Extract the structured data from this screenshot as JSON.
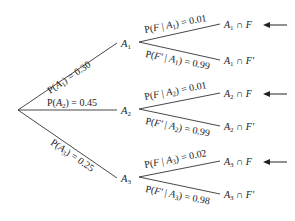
{
  "diagram": {
    "type": "probability-tree",
    "root": "",
    "level1": [
      {
        "node": "A1",
        "label": "P(A1) = 0.30"
      },
      {
        "node": "A2",
        "label": "P(A2) = 0.45"
      },
      {
        "node": "A3",
        "label": "P(A3) = 0.25"
      }
    ],
    "level2": [
      {
        "parent": "A1",
        "label": "P(F | A1) = 0.01",
        "outcome": "A1 ∩ F",
        "highlighted": true
      },
      {
        "parent": "A1",
        "label": "P(F′ | A1) = 0.99",
        "outcome": "A1 ∩ F′",
        "highlighted": false
      },
      {
        "parent": "A2",
        "label": "P(F | A2) = 0.01",
        "outcome": "A2 ∩ F",
        "highlighted": true
      },
      {
        "parent": "A2",
        "label": "P(F′ | A2) = 0.99",
        "outcome": "A2 ∩ F′",
        "highlighted": false
      },
      {
        "parent": "A3",
        "label": "P(F | A3) = 0.02",
        "outcome": "A3 ∩ F",
        "highlighted": true
      },
      {
        "parent": "A3",
        "label": "P(F′ | A3) = 0.98",
        "outcome": "A3 ∩ F′",
        "highlighted": false
      }
    ],
    "arrow_icon": "left-arrow"
  },
  "text": {
    "pA1_pre": "P(",
    "pA1_var": "A",
    "pA1_sub": "1",
    "pA1_post": ") = 0.30",
    "pA2_pre": "P(",
    "pA2_var": "A",
    "pA2_sub": "2",
    "pA2_post": ") = 0.45",
    "pA3_pre": "P(",
    "pA3_var": "A",
    "pA3_sub": "3",
    "pA3_post": ") = 0.25",
    "n1_var": "A",
    "n1_sub": "1",
    "n2_var": "A",
    "n2_sub": "2",
    "n3_var": "A",
    "n3_sub": "3",
    "b1_pre": "P(",
    "b1_var": "F",
    "b1_mid": " | ",
    "b1_A": "A",
    "b1_sub": "1",
    "b1_post": ") = 0.01",
    "b2_pre": "P(",
    "b2_var": "F′",
    "b2_mid": " | ",
    "b2_A": "A",
    "b2_sub": "1",
    "b2_post": ") = 0.99",
    "b3_pre": "P(",
    "b3_var": "F",
    "b3_mid": " | ",
    "b3_A": "A",
    "b3_sub": "2",
    "b3_post": ") = 0.01",
    "b4_pre": "P(",
    "b4_var": "F′",
    "b4_mid": " | ",
    "b4_A": "A",
    "b4_sub": "2",
    "b4_post": ") = 0.99",
    "b5_pre": "P(",
    "b5_var": "F",
    "b5_mid": " | ",
    "b5_A": "A",
    "b5_sub": "3",
    "b5_post": ") = 0.02",
    "b6_pre": "P(",
    "b6_var": "F′",
    "b6_mid": " | ",
    "b6_A": "A",
    "b6_sub": "3",
    "b6_post": ") = 0.98",
    "o1_A": "A",
    "o1_sub": "1",
    "o1_rest": " ∩ F",
    "o2_A": "A",
    "o2_sub": "1",
    "o2_rest": " ∩ F′",
    "o3_A": "A",
    "o3_sub": "2",
    "o3_rest": " ∩ F",
    "o4_A": "A",
    "o4_sub": "2",
    "o4_rest": " ∩ F′",
    "o5_A": "A",
    "o5_sub": "3",
    "o5_rest": " ∩ F",
    "o6_A": "A",
    "o6_sub": "3",
    "o6_rest": " ∩ F′"
  }
}
